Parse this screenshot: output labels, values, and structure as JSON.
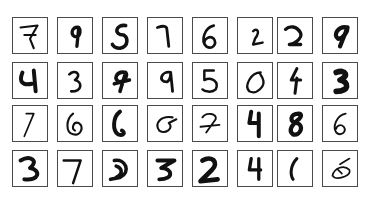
{
  "grid": {
    "rows": 4,
    "cols": 8,
    "digits": [
      [
        "7",
        "9",
        "9",
        "1",
        "6",
        "2",
        "2",
        "9"
      ],
      [
        "4",
        "3",
        "9",
        "9",
        "3",
        "0",
        "4",
        "3"
      ],
      [
        "7",
        "0",
        "6",
        "6",
        "7",
        "4",
        "8",
        "6"
      ],
      [
        "3",
        "7",
        "2",
        "3",
        "2",
        "4",
        "1",
        "5"
      ]
    ]
  }
}
